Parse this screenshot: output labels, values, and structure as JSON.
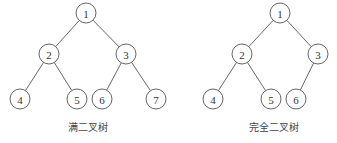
{
  "trees": [
    {
      "caption": "满二叉树",
      "caption_pos": [
        88,
        131
      ],
      "nodes": [
        {
          "label": "1",
          "x": 86,
          "y": 13
        },
        {
          "label": "2",
          "x": 49,
          "y": 54
        },
        {
          "label": "3",
          "x": 126,
          "y": 54
        },
        {
          "label": "4",
          "x": 20,
          "y": 99
        },
        {
          "label": "5",
          "x": 77,
          "y": 99
        },
        {
          "label": "6",
          "x": 102,
          "y": 99
        },
        {
          "label": "7",
          "x": 156,
          "y": 99
        }
      ],
      "edges": [
        [
          0,
          1
        ],
        [
          0,
          2
        ],
        [
          1,
          3
        ],
        [
          1,
          4
        ],
        [
          2,
          5
        ],
        [
          2,
          6
        ]
      ]
    },
    {
      "caption": "完全二叉树",
      "caption_pos": [
        274,
        131
      ],
      "nodes": [
        {
          "label": "1",
          "x": 280,
          "y": 13
        },
        {
          "label": "2",
          "x": 242,
          "y": 54
        },
        {
          "label": "3",
          "x": 318,
          "y": 54
        },
        {
          "label": "4",
          "x": 213,
          "y": 99
        },
        {
          "label": "5",
          "x": 271,
          "y": 99
        },
        {
          "label": "6",
          "x": 296,
          "y": 99
        }
      ],
      "edges": [
        [
          0,
          1
        ],
        [
          0,
          2
        ],
        [
          1,
          3
        ],
        [
          1,
          4
        ],
        [
          2,
          5
        ]
      ]
    }
  ],
  "node_radius": 10
}
